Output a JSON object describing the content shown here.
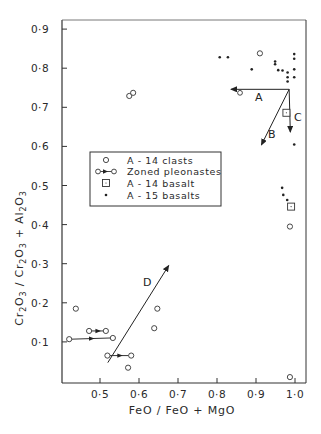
{
  "chart_data": {
    "type": "scatter",
    "title": "",
    "xlabel": "FeO / FeO + MgO",
    "ylabel": "Cr2O3 / Cr2O3 + Al2O3",
    "xlim": [
      0.4,
      1.01
    ],
    "ylim": [
      0.0,
      0.92
    ],
    "grid": false,
    "legend_position": "inside-left-middle",
    "x_ticks": [
      0.5,
      0.6,
      0.7,
      0.8,
      0.9,
      1.0
    ],
    "x_tick_labels": [
      "0·5",
      "0·6",
      "0·7",
      "0·8",
      "0·9",
      "1·0"
    ],
    "y_ticks": [
      0.1,
      0.2,
      0.3,
      0.4,
      0.5,
      0.6,
      0.7,
      0.8,
      0.9
    ],
    "y_tick_labels": [
      "0·1",
      "0·2",
      "0·3",
      "0·4",
      "0·5",
      "0·6",
      "0·7",
      "0·8",
      "0·9"
    ],
    "series": [
      {
        "name": "A - 14 clasts",
        "marker": "open-circle",
        "points": [
          [
            0.438,
            0.185
          ],
          [
            0.572,
            0.034
          ],
          [
            0.639,
            0.135
          ],
          [
            0.647,
            0.185
          ],
          [
            0.575,
            0.729
          ],
          [
            0.585,
            0.737
          ],
          [
            0.91,
            0.838
          ],
          [
            0.987,
            0.395
          ],
          [
            0.987,
            0.01
          ]
        ]
      },
      {
        "name": "Zoned pleonastes",
        "marker": "open-circle-arrow",
        "segments": [
          {
            "from": [
              0.421,
              0.107
            ],
            "to": [
              0.533,
              0.11
            ]
          },
          {
            "from": [
              0.472,
              0.128
            ],
            "to": [
              0.515,
              0.128
            ]
          },
          {
            "from": [
              0.519,
              0.065
            ],
            "to": [
              0.58,
              0.065
            ]
          }
        ]
      },
      {
        "name": "A - 14 basalt",
        "marker": "open-square",
        "points": [
          [
            0.978,
            0.686
          ],
          [
            0.99,
            0.446
          ]
        ]
      },
      {
        "name": "A - 15 basalts",
        "marker": "dot",
        "points": [
          [
            0.807,
            0.828
          ],
          [
            0.828,
            0.828
          ],
          [
            0.889,
            0.797
          ],
          [
            0.949,
            0.817
          ],
          [
            0.949,
            0.81
          ],
          [
            0.957,
            0.795
          ],
          [
            0.968,
            0.794
          ],
          [
            0.981,
            0.789
          ],
          [
            0.981,
            0.777
          ],
          [
            0.981,
            0.766
          ],
          [
            0.998,
            0.836
          ],
          [
            0.998,
            0.824
          ],
          [
            0.998,
            0.797
          ],
          [
            0.998,
            0.777
          ],
          [
            0.998,
            0.605
          ],
          [
            0.967,
            0.494
          ],
          [
            0.97,
            0.476
          ],
          [
            0.98,
            0.463
          ]
        ]
      }
    ],
    "annotations": [
      {
        "label": "A",
        "type": "vector",
        "from": [
          0.985,
          0.746
        ],
        "to": [
          0.836,
          0.746
        ],
        "end_marker": "open-circle at 0.859"
      },
      {
        "label": "B",
        "type": "vector",
        "from": [
          0.985,
          0.746
        ],
        "to": [
          0.914,
          0.604
        ]
      },
      {
        "label": "C",
        "type": "vector",
        "from": [
          0.985,
          0.746
        ],
        "to": [
          0.988,
          0.637
        ]
      },
      {
        "label": "D",
        "type": "vector",
        "from": [
          0.52,
          0.047
        ],
        "to": [
          0.676,
          0.295
        ]
      }
    ]
  },
  "labels": {
    "xlabel": "FeO / FeO + MgO",
    "ylabel_parts": {
      "cr1": "Cr",
      "s1": "2",
      "o1": "O",
      "s2": "3",
      "slash": " / ",
      "cr2": "Cr",
      "s3": "2",
      "o2": "O",
      "s4": "3",
      "plus": " + ",
      "al": "Al",
      "s5": "2",
      "o3": "O",
      "s6": "3"
    },
    "legend": [
      {
        "label": "A - 14 clasts"
      },
      {
        "label": "Zoned pleonastes"
      },
      {
        "label": "A - 14 basalt"
      },
      {
        "label": "A - 15 basalts"
      }
    ],
    "annotations": {
      "A": "A",
      "B": "B",
      "C": "C",
      "D": "D"
    }
  }
}
